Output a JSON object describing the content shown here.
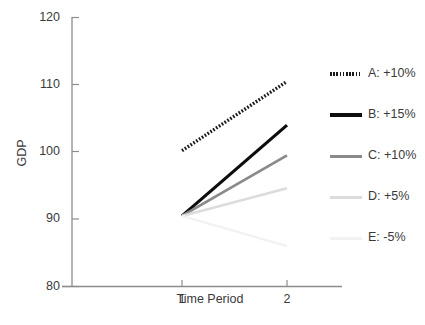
{
  "chart_data": {
    "type": "line",
    "title": "",
    "xlabel": "Time Period",
    "ylabel": "GDP",
    "x": [
      1,
      2
    ],
    "xlim": [
      0.55,
      2.45
    ],
    "ylim": [
      80,
      120
    ],
    "yticks": [
      80,
      90,
      100,
      110,
      120
    ],
    "xticks": [
      "1",
      "2"
    ],
    "grid": false,
    "legend_position": "right",
    "series": [
      {
        "name": "A: +10%",
        "label": "A:  +10%",
        "values": [
          100.2,
          110.5
        ],
        "color": "#1a1a1a",
        "style": "dotted",
        "width": 3.4
      },
      {
        "name": "B: +15%",
        "label": "B:  +15%",
        "values": [
          90.5,
          104.0
        ],
        "color": "#0d0d0d",
        "style": "solid",
        "width": 3.2
      },
      {
        "name": "C: +10%",
        "label": "C:  +10%",
        "values": [
          90.5,
          99.5
        ],
        "color": "#8a8a8a",
        "style": "solid",
        "width": 2.8
      },
      {
        "name": "D: +5%",
        "label": "D:  +5%",
        "values": [
          90.5,
          94.6
        ],
        "color": "#dcdcdc",
        "style": "solid",
        "width": 2.6
      },
      {
        "name": "E: -5%",
        "label": "E:  -5%",
        "values": [
          90.5,
          86.0
        ],
        "color": "#f2f2f2",
        "style": "solid",
        "width": 2.4
      }
    ]
  },
  "axis": {
    "y_tick_labels": [
      "120",
      "110",
      "100",
      "90",
      "80"
    ],
    "x_tick_labels": [
      "1",
      "2"
    ],
    "y_title": "GDP",
    "x_title": "Time Period",
    "axis_color": "#8c8c8c"
  },
  "legend": {
    "entries": [
      {
        "label": "A:  +10%"
      },
      {
        "label": "B:  +15%"
      },
      {
        "label": "C:  +10%"
      },
      {
        "label": "D:  +5%"
      },
      {
        "label": "E:  -5%"
      }
    ]
  }
}
